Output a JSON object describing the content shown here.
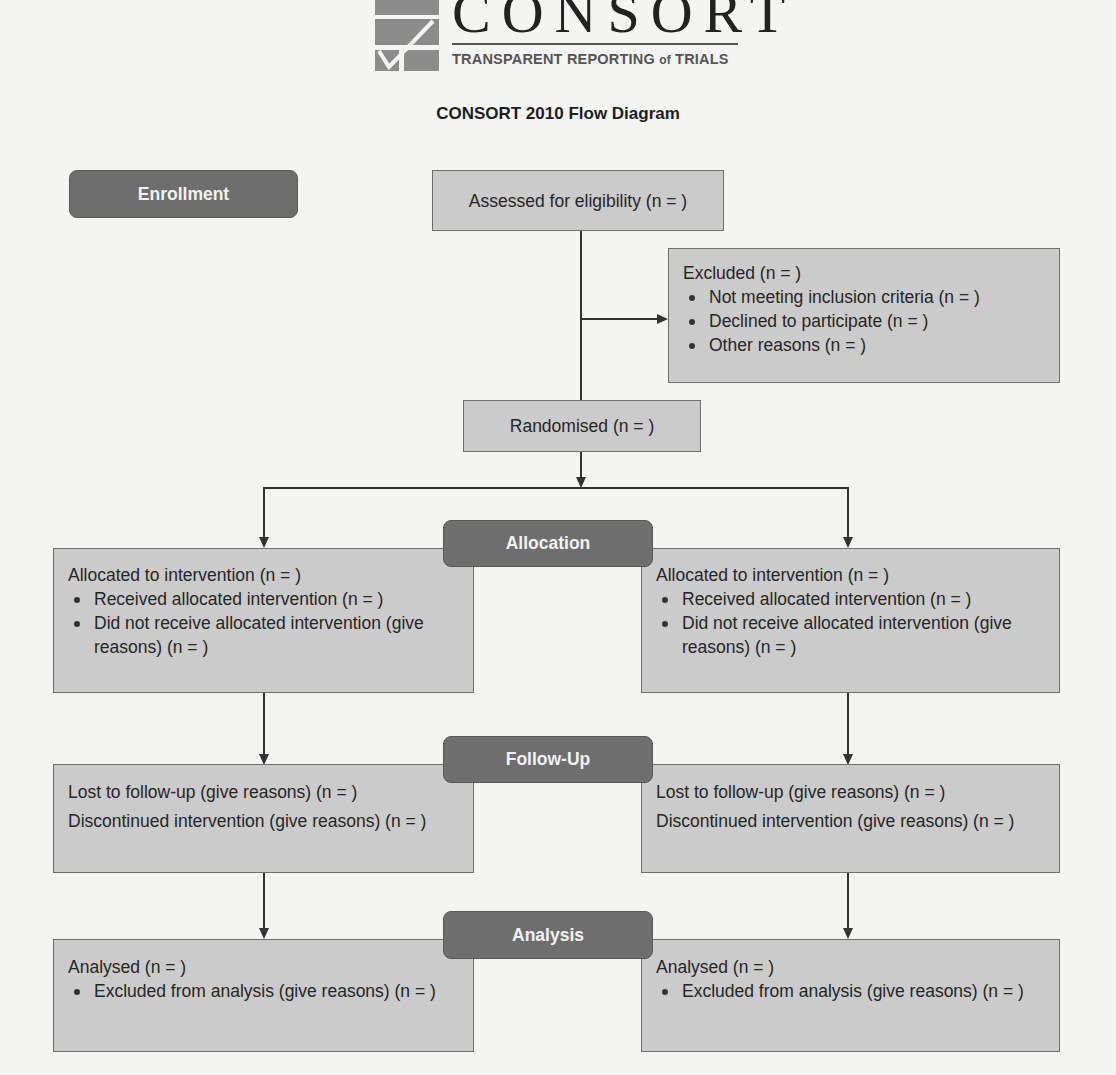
{
  "logo": {
    "title": "CONSORT",
    "subtitle_main": "TRANSPARENT REPORTING ",
    "subtitle_of": "of",
    "subtitle_end": " TRIALS"
  },
  "diagram_title": "CONSORT 2010 Flow Diagram",
  "stages": {
    "enrollment": "Enrollment",
    "allocation": "Allocation",
    "follow_up": "Follow-Up",
    "analysis": "Analysis"
  },
  "enrollment": {
    "assessed": "Assessed for eligibility (n =  )",
    "excluded": {
      "heading": "Excluded (n =  )",
      "items": [
        "Not meeting inclusion criteria (n =  )",
        "Declined to participate (n =  )",
        "Other reasons (n =  )"
      ]
    },
    "randomised": "Randomised (n =  )"
  },
  "allocation": {
    "left": {
      "heading": "Allocated to intervention (n =  )",
      "items": [
        "Received allocated intervention (n =  )",
        "Did not receive allocated intervention (give reasons) (n =  )"
      ]
    },
    "right": {
      "heading": "Allocated to intervention (n =  )",
      "items": [
        "Received allocated intervention (n =  )",
        "Did not receive allocated intervention (give reasons) (n =  )"
      ]
    }
  },
  "follow_up": {
    "left": {
      "lost": "Lost to follow-up (give reasons) (n =  )",
      "discontinued": "Discontinued intervention (give reasons) (n =  )"
    },
    "right": {
      "lost": "Lost to follow-up (give reasons) (n =  )",
      "discontinued": "Discontinued intervention (give reasons) (n =  )"
    }
  },
  "analysis": {
    "left": {
      "heading": "Analysed (n =  )",
      "items": [
        "Excluded from analysis (give reasons) (n =  )"
      ]
    },
    "right": {
      "heading": "Analysed (n =  )",
      "items": [
        "Excluded from analysis (give reasons) (n =  )"
      ]
    }
  },
  "colors": {
    "box_fill": "#cbcbcb",
    "box_border": "#6e6e6e",
    "stage_fill": "#6e6e6e",
    "stage_text": "#f2f2f2",
    "background": "#f4f4f3"
  }
}
